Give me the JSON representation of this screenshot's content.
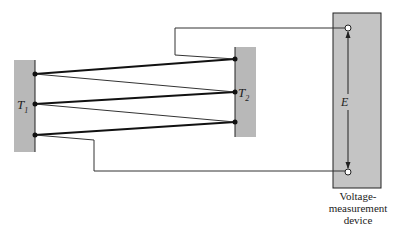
{
  "diagram": {
    "type": "thermopile-circuit",
    "junction_blocks": [
      {
        "id": "T1",
        "label_main": "T",
        "label_sub": "1",
        "fill": "#b8b8b8"
      },
      {
        "id": "T2",
        "label_main": "T",
        "label_sub": "2",
        "fill": "#b8b8b8"
      }
    ],
    "device": {
      "fill": "#c4c4c4",
      "voltage_label": "E",
      "caption_lines": [
        "Voltage-",
        "measurement",
        "device"
      ]
    },
    "thermocouple_pairs": 3,
    "colors": {
      "wire": "#222222",
      "background": "#ffffff"
    }
  }
}
